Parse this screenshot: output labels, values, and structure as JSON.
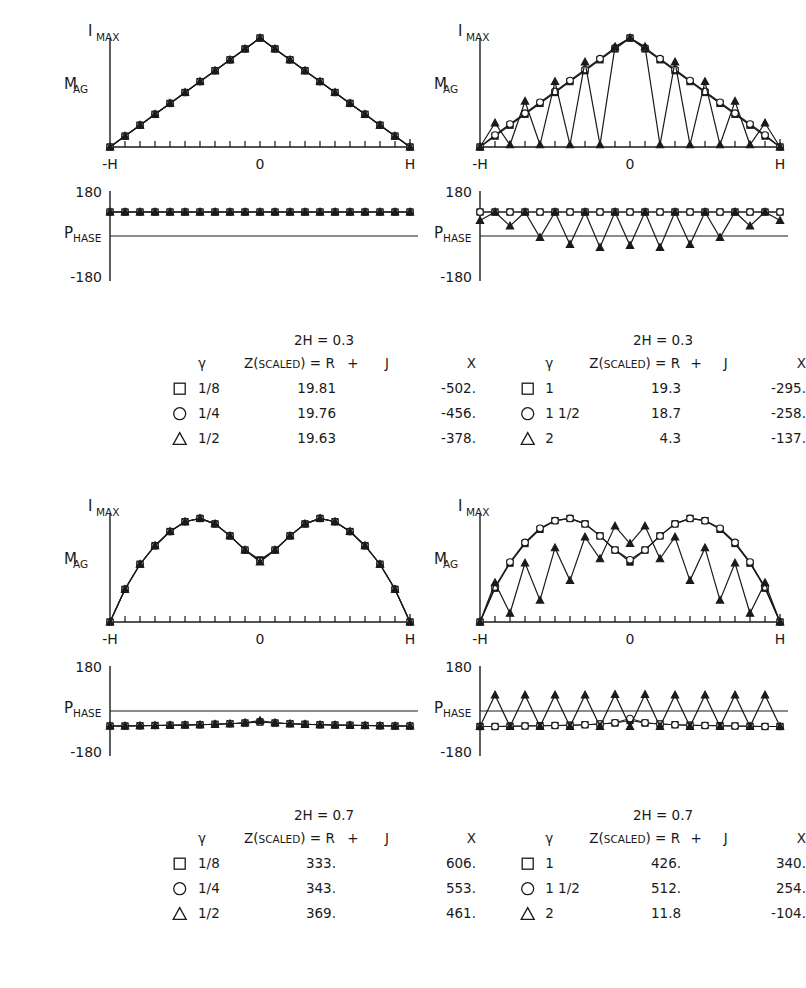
{
  "axes": {
    "ymax_label": "I",
    "ymax_sub": "MAX",
    "mag_label": "M",
    "mag_sub": "AG",
    "phase_label": "P",
    "phase_sub": "HASE",
    "x_left": "-H",
    "x_mid": "0",
    "x_right": "H",
    "phase_top": "180",
    "phase_bottom": "-180"
  },
  "legend_header": {
    "gamma": "γ",
    "z_main": "Z(",
    "z_scaled": "SCALED",
    "z_close": ") =",
    "r": "R",
    "plus": "+",
    "j": "J",
    "x": "X"
  },
  "panels": [
    {
      "id": "top-left",
      "condition": "2H = 0.3",
      "rows": [
        {
          "symbol": "square",
          "gamma": "1/8",
          "R": "19.81",
          "X": "-502."
        },
        {
          "symbol": "circle",
          "gamma": "1/4",
          "R": "19.76",
          "X": "-456."
        },
        {
          "symbol": "triangle",
          "gamma": "1/2",
          "R": "19.63",
          "X": "-378."
        }
      ]
    },
    {
      "id": "top-right",
      "condition": "2H = 0.3",
      "rows": [
        {
          "symbol": "square",
          "gamma": "1",
          "R": "19.3",
          "X": "-295."
        },
        {
          "symbol": "circle",
          "gamma": "1 1/2",
          "R": "18.7",
          "X": "-258."
        },
        {
          "symbol": "triangle",
          "gamma": "2",
          "R": "4.3",
          "X": "-137."
        }
      ]
    },
    {
      "id": "bottom-left",
      "condition": "2H = 0.7",
      "rows": [
        {
          "symbol": "square",
          "gamma": "1/8",
          "R": "333.",
          "X": "606."
        },
        {
          "symbol": "circle",
          "gamma": "1/4",
          "R": "343.",
          "X": "553."
        },
        {
          "symbol": "triangle",
          "gamma": "1/2",
          "R": "369.",
          "X": "461."
        }
      ]
    },
    {
      "id": "bottom-right",
      "condition": "2H = 0.7",
      "rows": [
        {
          "symbol": "square",
          "gamma": "1",
          "R": "426.",
          "X": "340."
        },
        {
          "symbol": "circle",
          "gamma": "1 1/2",
          "R": "512.",
          "X": "254."
        },
        {
          "symbol": "triangle",
          "gamma": "2",
          "R": "11.8",
          "X": "-104."
        }
      ]
    }
  ],
  "chart_data": [
    {
      "id": "top-left-mag",
      "type": "line",
      "title": "2H = 0.3 magnitude",
      "xlabel": "",
      "ylabel": "MAG",
      "xlim": [
        -1,
        1
      ],
      "ylim": [
        0,
        1
      ],
      "grid": false,
      "x": [
        -1.0,
        -0.9,
        -0.8,
        -0.7,
        -0.6,
        -0.5,
        -0.4,
        -0.3,
        -0.2,
        -0.1,
        0.0,
        0.1,
        0.2,
        0.3,
        0.4,
        0.5,
        0.6,
        0.7,
        0.8,
        0.9,
        1.0
      ],
      "series": [
        {
          "name": "1/8",
          "marker": "square",
          "values": [
            0.0,
            0.1,
            0.2,
            0.3,
            0.4,
            0.5,
            0.6,
            0.7,
            0.8,
            0.9,
            1.0,
            0.9,
            0.8,
            0.7,
            0.6,
            0.5,
            0.4,
            0.3,
            0.2,
            0.1,
            0.0
          ]
        },
        {
          "name": "1/4",
          "marker": "circle",
          "values": [
            0.0,
            0.1,
            0.2,
            0.3,
            0.4,
            0.5,
            0.6,
            0.7,
            0.8,
            0.9,
            1.0,
            0.9,
            0.8,
            0.7,
            0.6,
            0.5,
            0.4,
            0.3,
            0.2,
            0.1,
            0.0
          ]
        },
        {
          "name": "1/2",
          "marker": "triangle",
          "values": [
            0.0,
            0.1,
            0.2,
            0.3,
            0.4,
            0.5,
            0.6,
            0.7,
            0.8,
            0.9,
            1.0,
            0.9,
            0.8,
            0.7,
            0.6,
            0.5,
            0.4,
            0.3,
            0.2,
            0.1,
            0.0
          ]
        }
      ]
    },
    {
      "id": "top-left-phase",
      "type": "line",
      "title": "2H = 0.3 phase",
      "xlabel": "",
      "ylabel": "PHASE",
      "xlim": [
        -1,
        1
      ],
      "ylim": [
        -180,
        180
      ],
      "grid": false,
      "x": [
        -1.0,
        -0.9,
        -0.8,
        -0.7,
        -0.6,
        -0.5,
        -0.4,
        -0.3,
        -0.2,
        -0.1,
        0.0,
        0.1,
        0.2,
        0.3,
        0.4,
        0.5,
        0.6,
        0.7,
        0.8,
        0.9,
        1.0
      ],
      "series": [
        {
          "name": "1/8",
          "marker": "square",
          "values": [
            96,
            96,
            96,
            96,
            96,
            96,
            96,
            96,
            96,
            96,
            96,
            96,
            96,
            96,
            96,
            96,
            96,
            96,
            96,
            96,
            96
          ]
        },
        {
          "name": "1/4",
          "marker": "circle",
          "values": [
            96,
            96,
            96,
            96,
            96,
            96,
            96,
            96,
            96,
            96,
            96,
            96,
            96,
            96,
            96,
            96,
            96,
            96,
            96,
            96,
            96
          ]
        },
        {
          "name": "1/2",
          "marker": "triangle",
          "values": [
            96,
            96,
            96,
            96,
            96,
            96,
            96,
            96,
            96,
            96,
            96,
            96,
            96,
            96,
            96,
            96,
            96,
            96,
            96,
            96,
            96
          ]
        }
      ]
    },
    {
      "id": "top-right-mag",
      "type": "line",
      "title": "2H = 0.3 magnitude",
      "xlabel": "",
      "ylabel": "MAG",
      "xlim": [
        -1,
        1
      ],
      "ylim": [
        0,
        1
      ],
      "grid": false,
      "x": [
        -1.0,
        -0.9,
        -0.8,
        -0.7,
        -0.6,
        -0.5,
        -0.4,
        -0.3,
        -0.2,
        -0.1,
        0.0,
        0.1,
        0.2,
        0.3,
        0.4,
        0.5,
        0.6,
        0.7,
        0.8,
        0.9,
        1.0
      ],
      "series": [
        {
          "name": "1",
          "marker": "square",
          "values": [
            0.0,
            0.1,
            0.2,
            0.3,
            0.4,
            0.5,
            0.6,
            0.7,
            0.8,
            0.9,
            1.0,
            0.9,
            0.8,
            0.7,
            0.6,
            0.5,
            0.4,
            0.3,
            0.2,
            0.1,
            0.0
          ]
        },
        {
          "name": "1 1/2",
          "marker": "circle",
          "values": [
            0.0,
            0.11,
            0.21,
            0.31,
            0.41,
            0.51,
            0.61,
            0.71,
            0.81,
            0.91,
            1.0,
            0.91,
            0.81,
            0.71,
            0.61,
            0.51,
            0.41,
            0.31,
            0.21,
            0.11,
            0.0
          ]
        },
        {
          "name": "2",
          "marker": "triangle",
          "values": [
            0.0,
            0.22,
            0.02,
            0.42,
            0.02,
            0.6,
            0.02,
            0.78,
            0.02,
            0.92,
            1.0,
            0.92,
            0.02,
            0.78,
            0.02,
            0.6,
            0.02,
            0.42,
            0.02,
            0.22,
            0.0
          ]
        }
      ]
    },
    {
      "id": "top-right-phase",
      "type": "line",
      "title": "2H = 0.3 phase",
      "xlabel": "",
      "ylabel": "PHASE",
      "xlim": [
        -1,
        1
      ],
      "ylim": [
        -180,
        180
      ],
      "grid": false,
      "x": [
        -1.0,
        -0.9,
        -0.8,
        -0.7,
        -0.6,
        -0.5,
        -0.4,
        -0.3,
        -0.2,
        -0.1,
        0.0,
        0.1,
        0.2,
        0.3,
        0.4,
        0.5,
        0.6,
        0.7,
        0.8,
        0.9,
        1.0
      ],
      "series": [
        {
          "name": "1",
          "marker": "square",
          "values": [
            96,
            96,
            96,
            96,
            96,
            96,
            96,
            96,
            96,
            96,
            96,
            96,
            96,
            96,
            96,
            96,
            96,
            96,
            96,
            96,
            96
          ]
        },
        {
          "name": "1 1/2",
          "marker": "circle",
          "values": [
            96,
            96,
            96,
            96,
            96,
            96,
            96,
            96,
            96,
            96,
            96,
            96,
            96,
            96,
            96,
            96,
            96,
            96,
            96,
            96,
            96
          ]
        },
        {
          "name": "2",
          "marker": "triangle",
          "values": [
            62,
            96,
            40,
            96,
            -6,
            96,
            -34,
            96,
            -46,
            96,
            -38,
            96,
            -46,
            96,
            -34,
            96,
            -6,
            96,
            40,
            96,
            62
          ]
        }
      ]
    },
    {
      "id": "bottom-left-mag",
      "type": "line",
      "title": "2H = 0.7 magnitude",
      "xlabel": "",
      "ylabel": "MAG",
      "xlim": [
        -1,
        1
      ],
      "ylim": [
        0,
        1
      ],
      "grid": false,
      "x": [
        -1.0,
        -0.9,
        -0.8,
        -0.7,
        -0.6,
        -0.5,
        -0.4,
        -0.3,
        -0.2,
        -0.1,
        0.0,
        0.1,
        0.2,
        0.3,
        0.4,
        0.5,
        0.6,
        0.7,
        0.8,
        0.9,
        1.0
      ],
      "series": [
        {
          "name": "1/8",
          "marker": "square",
          "values": [
            0.0,
            0.3,
            0.53,
            0.7,
            0.83,
            0.92,
            0.95,
            0.9,
            0.79,
            0.66,
            0.57,
            0.66,
            0.79,
            0.9,
            0.95,
            0.92,
            0.83,
            0.7,
            0.53,
            0.3,
            0.0
          ]
        },
        {
          "name": "1/4",
          "marker": "circle",
          "values": [
            0.0,
            0.3,
            0.53,
            0.7,
            0.83,
            0.92,
            0.95,
            0.9,
            0.79,
            0.66,
            0.56,
            0.66,
            0.79,
            0.9,
            0.95,
            0.92,
            0.83,
            0.7,
            0.53,
            0.3,
            0.0
          ]
        },
        {
          "name": "1/2",
          "marker": "triangle",
          "values": [
            0.0,
            0.3,
            0.53,
            0.7,
            0.83,
            0.92,
            0.95,
            0.9,
            0.79,
            0.66,
            0.55,
            0.66,
            0.79,
            0.9,
            0.95,
            0.92,
            0.83,
            0.7,
            0.53,
            0.3,
            0.0
          ]
        }
      ]
    },
    {
      "id": "bottom-left-phase",
      "type": "line",
      "title": "2H = 0.7 phase",
      "xlabel": "",
      "ylabel": "PHASE",
      "xlim": [
        -1,
        1
      ],
      "ylim": [
        -180,
        180
      ],
      "grid": false,
      "x": [
        -1.0,
        -0.9,
        -0.8,
        -0.7,
        -0.6,
        -0.5,
        -0.4,
        -0.3,
        -0.2,
        -0.1,
        0.0,
        0.1,
        0.2,
        0.3,
        0.4,
        0.5,
        0.6,
        0.7,
        0.8,
        0.9,
        1.0
      ],
      "series": [
        {
          "name": "1/8",
          "marker": "square",
          "values": [
            -60,
            -60,
            -59,
            -58,
            -57,
            -56,
            -55,
            -53,
            -51,
            -48,
            -44,
            -48,
            -51,
            -53,
            -55,
            -56,
            -57,
            -58,
            -59,
            -60,
            -60
          ]
        },
        {
          "name": "1/4",
          "marker": "circle",
          "values": [
            -60,
            -60,
            -59,
            -58,
            -57,
            -56,
            -55,
            -53,
            -51,
            -48,
            -43,
            -48,
            -51,
            -53,
            -55,
            -56,
            -57,
            -58,
            -59,
            -60,
            -60
          ]
        },
        {
          "name": "1/2",
          "marker": "triangle",
          "values": [
            -60,
            -60,
            -59,
            -58,
            -57,
            -56,
            -55,
            -53,
            -51,
            -47,
            -38,
            -47,
            -51,
            -53,
            -55,
            -56,
            -57,
            -58,
            -59,
            -60,
            -60
          ]
        }
      ]
    },
    {
      "id": "bottom-right-mag",
      "type": "line",
      "title": "2H = 0.7 magnitude",
      "xlabel": "",
      "ylabel": "MAG",
      "xlim": [
        -1,
        1
      ],
      "ylim": [
        0,
        1
      ],
      "grid": false,
      "x": [
        -1.0,
        -0.9,
        -0.8,
        -0.7,
        -0.6,
        -0.5,
        -0.4,
        -0.3,
        -0.2,
        -0.1,
        0.0,
        0.1,
        0.2,
        0.3,
        0.4,
        0.5,
        0.6,
        0.7,
        0.8,
        0.9,
        1.0
      ],
      "series": [
        {
          "name": "1",
          "marker": "square",
          "values": [
            0.0,
            0.31,
            0.54,
            0.72,
            0.85,
            0.93,
            0.95,
            0.9,
            0.79,
            0.66,
            0.55,
            0.66,
            0.79,
            0.9,
            0.95,
            0.93,
            0.85,
            0.72,
            0.54,
            0.31,
            0.0
          ]
        },
        {
          "name": "1 1/2",
          "marker": "circle",
          "values": [
            0.0,
            0.32,
            0.55,
            0.73,
            0.86,
            0.93,
            0.95,
            0.9,
            0.79,
            0.66,
            0.57,
            0.66,
            0.79,
            0.9,
            0.95,
            0.93,
            0.86,
            0.73,
            0.55,
            0.32,
            0.0
          ]
        },
        {
          "name": "2",
          "marker": "triangle",
          "values": [
            0.0,
            0.36,
            0.08,
            0.54,
            0.2,
            0.68,
            0.38,
            0.78,
            0.58,
            0.88,
            0.72,
            0.88,
            0.58,
            0.78,
            0.38,
            0.68,
            0.2,
            0.54,
            0.08,
            0.36,
            0.0
          ]
        }
      ]
    },
    {
      "id": "bottom-right-phase",
      "type": "line",
      "title": "2H = 0.7 phase",
      "xlabel": "",
      "ylabel": "PHASE",
      "xlim": [
        -1,
        1
      ],
      "ylim": [
        -180,
        180
      ],
      "grid": false,
      "x": [
        -1.0,
        -0.9,
        -0.8,
        -0.7,
        -0.6,
        -0.5,
        -0.4,
        -0.3,
        -0.2,
        -0.1,
        0.0,
        0.1,
        0.2,
        0.3,
        0.4,
        0.5,
        0.6,
        0.7,
        0.8,
        0.9,
        1.0
      ],
      "series": [
        {
          "name": "1",
          "marker": "square",
          "values": [
            -62,
            -62,
            -61,
            -60,
            -59,
            -58,
            -57,
            -55,
            -52,
            -48,
            -38,
            -48,
            -52,
            -55,
            -57,
            -58,
            -59,
            -60,
            -61,
            -62,
            -62
          ]
        },
        {
          "name": "1 1/2",
          "marker": "circle",
          "values": [
            -62,
            -62,
            -61,
            -60,
            -59,
            -58,
            -57,
            -55,
            -52,
            -47,
            -30,
            -47,
            -52,
            -55,
            -57,
            -58,
            -59,
            -60,
            -61,
            -62,
            -62
          ]
        },
        {
          "name": "2",
          "marker": "triangle",
          "values": [
            -62,
            64,
            -62,
            64,
            -62,
            64,
            -62,
            64,
            -62,
            66,
            -62,
            66,
            -62,
            64,
            -62,
            64,
            -62,
            64,
            -62,
            64,
            -62
          ]
        }
      ]
    }
  ]
}
